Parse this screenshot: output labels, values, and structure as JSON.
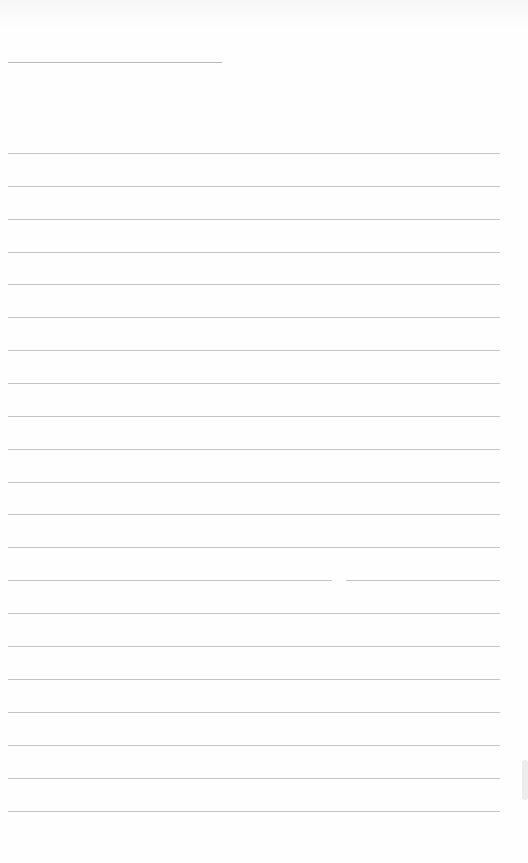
{
  "document": {
    "type": "ruled-page",
    "title_line": {
      "x": 8,
      "y": 62,
      "width": 214
    },
    "rules": {
      "x": 8,
      "width": 492,
      "y_positions": [
        153,
        186,
        219,
        252,
        284,
        317,
        350,
        383,
        416,
        449,
        482,
        514,
        547,
        580,
        613,
        646,
        679,
        712,
        745,
        778,
        811
      ],
      "gap_on_line_index": 13
    },
    "line_color": "#c4c4c4",
    "background_color": "#ffffff"
  }
}
